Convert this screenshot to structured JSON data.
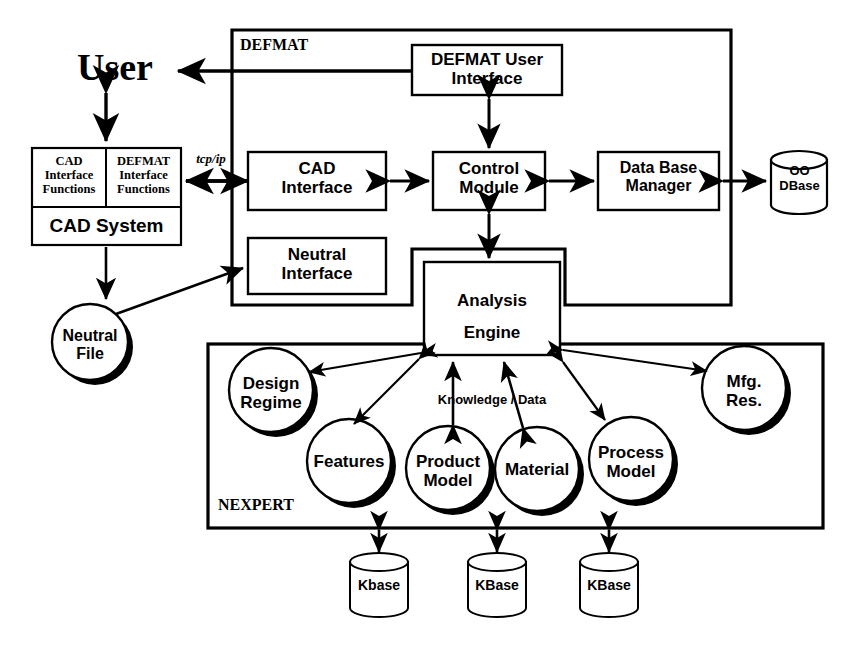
{
  "diagram": {
    "stroke_color": "#000000",
    "fill_color": "#ffffff",
    "shadow_color": "#000000"
  },
  "actors": {
    "user": "User"
  },
  "containers": {
    "defmat_label": "DEFMAT",
    "nexpert_label": "NEXPERT"
  },
  "cad_system": {
    "cell_left_line1": "CAD",
    "cell_left_line2": "Interface",
    "cell_left_line3": "Functions",
    "cell_right_line1": "DEFMAT",
    "cell_right_line2": "Interface",
    "cell_right_line3": "Functions",
    "title": "CAD System"
  },
  "boxes": {
    "defmat_user_interface_line1": "DEFMAT User",
    "defmat_user_interface_line2": "Interface",
    "cad_interface_line1": "CAD",
    "cad_interface_line2": "Interface",
    "control_module_line1": "Control",
    "control_module_line2": "Module",
    "data_base_manager_line1": "Data Base",
    "data_base_manager_line2": "Manager",
    "neutral_interface_line1": "Neutral",
    "neutral_interface_line2": "Interface",
    "analysis_engine_line1": "Analysis",
    "analysis_engine_line2": "Engine"
  },
  "cylinders": {
    "oo_dbase_line1": "OO",
    "oo_dbase_line2": "DBase",
    "kbase_1": "Kbase",
    "kbase_2": "KBase",
    "kbase_3": "KBase"
  },
  "circles": {
    "neutral_file_line1": "Neutral",
    "neutral_file_line2": "File",
    "design_regime_line1": "Design",
    "design_regime_line2": "Regime",
    "features": "Features",
    "product_model_line1": "Product",
    "product_model_line2": "Model",
    "material": "Material",
    "process_model_line1": "Process",
    "process_model_line2": "Model",
    "mfg_res_line1": "Mfg.",
    "mfg_res_line2": "Res."
  },
  "edge_labels": {
    "tcp_ip": "tcp/ip",
    "knowledge_data": "Knowledge / Data"
  }
}
